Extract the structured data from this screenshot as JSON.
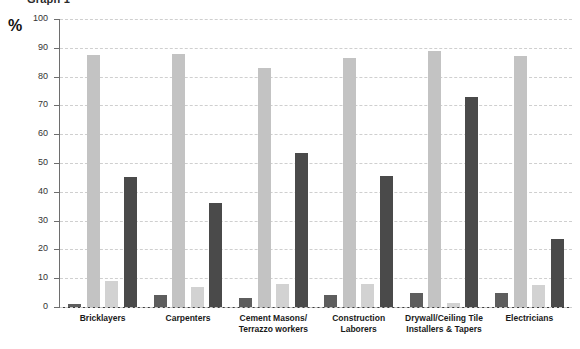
{
  "chart_data": {
    "type": "bar",
    "title": "Graph 1",
    "xlabel": "",
    "ylabel": "%",
    "ylim": [
      0,
      100
    ],
    "yticks": [
      0,
      10,
      20,
      30,
      40,
      50,
      60,
      70,
      80,
      90,
      100
    ],
    "grid": true,
    "legend": "none",
    "categories": [
      "Bricklayers",
      "Carpenters",
      "Cement Masons/\nTerrazzo workers",
      "Construction\nLaborers",
      "Drywall/Ceiling Tile\nInstallers & Tapers",
      "Electricians"
    ],
    "series": [
      {
        "name": "Series 1",
        "color": "#5e5e5e",
        "values": [
          1,
          4,
          3,
          4,
          5,
          5
        ]
      },
      {
        "name": "Series 2",
        "color": "#c3c3c3",
        "values": [
          87.5,
          88,
          83,
          86.5,
          89,
          87
        ]
      },
      {
        "name": "Series 3",
        "color": "#d2d2d2",
        "values": [
          9,
          7,
          8,
          8,
          1.5,
          7.5
        ]
      },
      {
        "name": "Series 4",
        "color": "#4a4a4a",
        "values": [
          45,
          36,
          53.5,
          45.5,
          73,
          23.5
        ]
      }
    ]
  },
  "axis": {
    "percent_symbol": "%"
  }
}
